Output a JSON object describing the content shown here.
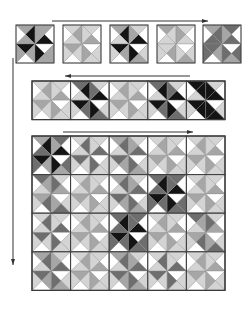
{
  "colors": {
    "white": "#ffffff",
    "light": "#d4d4d4",
    "mid": "#a6a6a6",
    "dark": "#6e6e6e",
    "black": "#141414",
    "outline": "#3a3a3a",
    "arrow": "#333333"
  },
  "arrows": [
    {
      "name": "arrow-top-right",
      "x1": 52,
      "y1": 21,
      "x2": 208,
      "y2": 21,
      "dir": "right"
    },
    {
      "name": "arrow-strip-left",
      "x1": 190,
      "y1": 76,
      "x2": 65,
      "y2": 76,
      "dir": "left"
    },
    {
      "name": "arrow-grid-right",
      "x1": 63,
      "y1": 132,
      "x2": 193,
      "y2": 132,
      "dir": "right"
    },
    {
      "name": "arrow-left-down",
      "x1": 13,
      "y1": 58,
      "x2": 13,
      "y2": 265,
      "dir": "down"
    }
  ],
  "row1_blocks": [
    {
      "x": 16,
      "y": 25,
      "size": 38,
      "scheme": [
        "black",
        "mid",
        "white",
        "mid"
      ]
    },
    {
      "x": 63,
      "y": 25,
      "size": 38,
      "scheme": [
        "mid",
        "light",
        "white",
        "light"
      ]
    },
    {
      "x": 110,
      "y": 25,
      "size": 38,
      "scheme": [
        "black",
        "mid",
        "white",
        "light"
      ]
    },
    {
      "x": 157,
      "y": 25,
      "size": 38,
      "scheme": [
        "light",
        "mid",
        "white",
        "light"
      ]
    },
    {
      "x": 203,
      "y": 25,
      "size": 38,
      "scheme": [
        "dark",
        "mid",
        "white",
        "dark"
      ]
    }
  ],
  "strip": {
    "x": 32,
    "y": 81,
    "cell": 19.3,
    "cols": 10,
    "rows": 2,
    "blocks": [
      {
        "scheme": [
          "mid",
          "light",
          "white",
          "light"
        ]
      },
      {
        "scheme": [
          "black",
          "dark",
          "white",
          "light"
        ]
      },
      {
        "scheme": [
          "mid",
          "light",
          "white",
          "light"
        ]
      },
      {
        "scheme": [
          "black",
          "dark",
          "white",
          "light"
        ]
      },
      {
        "scheme": [
          "black",
          "black",
          "white",
          "light"
        ]
      }
    ]
  },
  "grid": {
    "x": 32,
    "y": 136,
    "cell": 19.3,
    "cols": 10,
    "rows": 8,
    "blocks": [
      [
        "black",
        "mid"
      ],
      [
        "dark",
        "light"
      ],
      [
        "dark",
        "mid"
      ],
      [
        "mid",
        "light"
      ],
      [
        "mid",
        "light"
      ],
      [
        "mid",
        "dark"
      ],
      [
        "mid",
        "light"
      ],
      [
        "dark",
        "mid"
      ],
      [
        "black",
        "dark"
      ],
      [
        "mid",
        "light"
      ],
      [
        "dark",
        "light"
      ],
      [
        "mid",
        "light"
      ],
      [
        "black",
        "dark"
      ],
      [
        "mid",
        "light"
      ],
      [
        "mid",
        "dark"
      ],
      [
        "dark",
        "mid"
      ],
      [
        "mid",
        "light"
      ],
      [
        "dark",
        "mid"
      ],
      [
        "dark",
        "light"
      ],
      [
        "mid",
        "light"
      ]
    ]
  }
}
